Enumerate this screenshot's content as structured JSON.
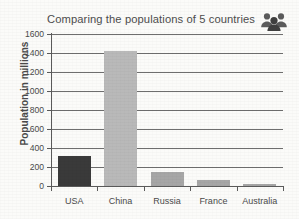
{
  "chart_data": {
    "type": "bar",
    "title": "Comparing the populations of 5 countries",
    "xlabel": "",
    "ylabel": "Population in millions",
    "categories": [
      "USA",
      "China",
      "Russia",
      "France",
      "Australia"
    ],
    "values": [
      320,
      1420,
      145,
      67,
      25
    ],
    "ylim": [
      0,
      1600
    ],
    "ytick_step": 200,
    "yticks": [
      0,
      200,
      400,
      600,
      800,
      1000,
      1200,
      1400,
      1600
    ],
    "ytick_labels": [
      "0",
      "200",
      "400",
      "600",
      "800",
      "1000",
      "1200",
      "1400",
      "1600"
    ],
    "grid": true,
    "legend": false,
    "bar_colors": [
      "#3a3a3a",
      "#b9b9b9",
      "#a6a6a6",
      "#a6a6a6",
      "#a6a6a6"
    ]
  },
  "icons": {
    "people_group": "people-group-icon"
  },
  "colors": {
    "axis": "#5a5a5a",
    "grid": "#6e6e6e",
    "text": "#4a4a4a",
    "background": "#fbfbf9",
    "bar_highlight": "#3a3a3a",
    "bar_default": "#b9b9b9"
  }
}
